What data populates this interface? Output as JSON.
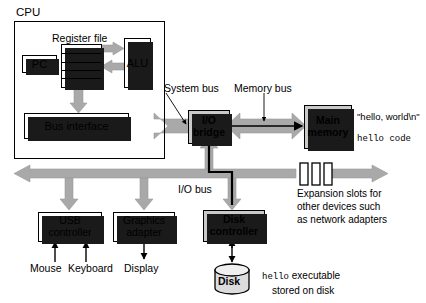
{
  "figure": {
    "colors": {
      "bus_gray": "#a9a9a9",
      "box_gray": "#c9c9c9",
      "outline": "#000000",
      "background": "#ffffff"
    }
  },
  "cpu": {
    "label": "CPU",
    "register_file": {
      "label": "Register file",
      "rows": 5
    },
    "pc": {
      "label": "PC"
    },
    "alu": {
      "label": "ALU"
    },
    "bus_interface": {
      "label": "Bus interface"
    }
  },
  "buses": {
    "system_bus": "System bus",
    "memory_bus": "Memory bus",
    "io_bus": "I/O bus"
  },
  "io_bridge": {
    "line1": "I/O",
    "line2": "bridge"
  },
  "main_memory": {
    "line1": "Main",
    "line2": "memory",
    "contents": [
      {
        "text": "\"hello, world\\n\"",
        "mono": false
      },
      {
        "text": "hello code",
        "mono": true
      }
    ]
  },
  "devices": {
    "usb_controller": {
      "line1": "USB",
      "line2": "controller"
    },
    "graphics_adapter": {
      "line1": "Graphics",
      "line2": "adapter"
    },
    "disk_controller": {
      "line1": "Disk",
      "line2": "controller"
    },
    "mouse": "Mouse",
    "keyboard": "Keyboard",
    "display": "Display",
    "disk": "Disk"
  },
  "expansion": {
    "slot_count": 3,
    "caption_lines": [
      "Expansion slots for",
      "other devices such",
      "as network adapters"
    ]
  },
  "disk_note": {
    "line1_mono": "hello",
    "line1_rest": " executable",
    "line2": "stored on disk"
  }
}
